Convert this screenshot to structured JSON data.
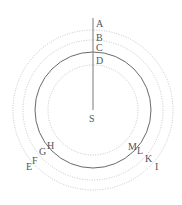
{
  "diagram": {
    "center": {
      "x": 93,
      "y": 110
    },
    "line": {
      "x": 93,
      "y1": 18,
      "y2": 110,
      "color": "#777777"
    },
    "circles": [
      {
        "name": "outer-dotted-circle",
        "r": 80,
        "style": "dotted",
        "color": "#bdbdbd"
      },
      {
        "name": "second-dotted-circle",
        "r": 70,
        "style": "dotted",
        "color": "#bdbdbd"
      },
      {
        "name": "solid-circle",
        "r": 58,
        "style": "solid",
        "color": "#666666"
      },
      {
        "name": "inner-dotted-circle",
        "r": 45,
        "style": "dotted",
        "color": "#bdbdbd"
      }
    ],
    "labels": {
      "A": "A",
      "B": "B",
      "C": "C",
      "D": "D",
      "S": "S",
      "E": "E",
      "F": "F",
      "G": "G",
      "H": "H",
      "I": "I",
      "K": "K",
      "L": "L",
      "M": "M"
    }
  }
}
